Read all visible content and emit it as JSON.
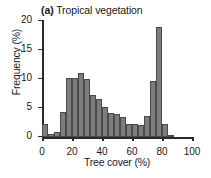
{
  "chart_data": {
    "type": "bar",
    "title": "(a) Tropical vegetation",
    "panel_letter": "(a)",
    "title_rest": " Tropical vegetation",
    "xlabel": "Tree cover (%)",
    "ylabel": "Frequency (%)",
    "xlim": [
      0,
      100
    ],
    "ylim": [
      0,
      20
    ],
    "xticks": [
      0,
      20,
      40,
      60,
      80,
      100
    ],
    "yticks": [
      0,
      5,
      10,
      15,
      20
    ],
    "grid": false,
    "legend": null,
    "bin_width": 4,
    "bar_color": "#7d7d7d",
    "bar_edge_color": "#4a4a4a",
    "axis_color": "#2a2a2a",
    "categories": [
      0,
      4,
      8,
      12,
      16,
      20,
      24,
      28,
      32,
      36,
      40,
      44,
      48,
      52,
      56,
      60,
      64,
      68,
      72,
      76,
      80,
      84,
      88,
      92,
      96
    ],
    "values": [
      2.3,
      0.6,
      0.9,
      4.3,
      10.1,
      10.2,
      11.0,
      10.0,
      7.2,
      6.6,
      5.2,
      4.2,
      4.0,
      3.5,
      2.2,
      2.2,
      2.0,
      3.7,
      9.6,
      19.0,
      2.3,
      0.4,
      0.0,
      0.0,
      0.0
    ],
    "series": [
      {
        "name": "Tropical vegetation tree cover frequency",
        "values": [
          2.3,
          0.6,
          0.9,
          4.3,
          10.1,
          10.2,
          11.0,
          10.0,
          7.2,
          6.6,
          5.2,
          4.2,
          4.0,
          3.5,
          2.2,
          2.2,
          2.0,
          3.7,
          9.6,
          19.0,
          2.3,
          0.4,
          0.0,
          0.0,
          0.0
        ]
      }
    ]
  }
}
